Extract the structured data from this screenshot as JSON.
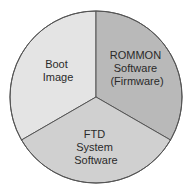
{
  "diagram": {
    "type": "pie",
    "segments": [
      {
        "id": "boot-image",
        "lines": [
          "Boot",
          "Image"
        ],
        "color": "#e4e4e4"
      },
      {
        "id": "rommon",
        "lines": [
          "ROMMON",
          "Software",
          "(Firmware)"
        ],
        "color": "#b9b9b9"
      },
      {
        "id": "ftd",
        "lines": [
          "FTD",
          "System",
          "Software"
        ],
        "color": "#d0d0d0"
      }
    ]
  }
}
